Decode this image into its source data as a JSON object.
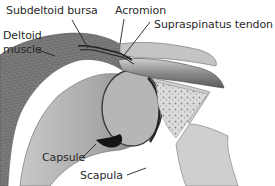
{
  "figure": {
    "style": "grayscale medical illustration",
    "colors": {
      "background": "#ffffff",
      "label_text": "#2a2a2a",
      "leader_line": "#222222"
    }
  },
  "labels": [
    {
      "id": "subdeltoid-bursa",
      "text": "Subdeltoid bursa"
    },
    {
      "id": "acromion",
      "text": "Acromion"
    },
    {
      "id": "supraspinatus-tendon",
      "text": "Supraspinatus tendon"
    },
    {
      "id": "deltoid-muscle-line1",
      "text": "Deltoid"
    },
    {
      "id": "deltoid-muscle-line2",
      "text": "muscle"
    },
    {
      "id": "capsule",
      "text": "Capsule"
    },
    {
      "id": "scapula",
      "text": "Scapula"
    }
  ]
}
